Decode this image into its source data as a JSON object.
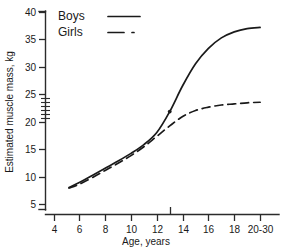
{
  "chart_data": {
    "type": "line",
    "title": "",
    "xlabel": "Age, years",
    "ylabel": "Estimated muscle mass, kg",
    "xlim": [
      4,
      21
    ],
    "ylim": [
      4,
      40
    ],
    "grid": false,
    "legend_position": "top-left",
    "x_tick_labels": [
      "4",
      "6",
      "8",
      "10",
      "12",
      "14",
      "16",
      "18",
      "20-30"
    ],
    "x_tick_values": [
      4,
      6,
      8,
      10,
      12,
      14,
      16,
      18,
      20
    ],
    "y_tick_labels": [
      "5",
      "10",
      "15",
      "20",
      "25",
      "30",
      "35",
      "40"
    ],
    "y_tick_values": [
      5,
      10,
      15,
      20,
      25,
      30,
      35,
      40
    ],
    "y_minor_tick_values": [
      20.7,
      21.4,
      22.1,
      22.8,
      23.5,
      24.2
    ],
    "x_marker_value": 13,
    "series": [
      {
        "name": "Boys",
        "style": "solid",
        "x": [
          5.2,
          6,
          7,
          8,
          9,
          10,
          11,
          12,
          13,
          14,
          15,
          16,
          17,
          18,
          19,
          20
        ],
        "values": [
          8.0,
          8.9,
          10.2,
          11.5,
          12.8,
          14.2,
          15.8,
          18.0,
          21.8,
          26.5,
          30.5,
          33.3,
          35.2,
          36.3,
          36.9,
          37.1
        ]
      },
      {
        "name": "Girls",
        "style": "dashed",
        "x": [
          5.2,
          6,
          7,
          8,
          9,
          10,
          11,
          12,
          13,
          14,
          15,
          16,
          17,
          18,
          19,
          20
        ],
        "values": [
          7.9,
          8.6,
          9.8,
          11.1,
          12.4,
          13.8,
          15.4,
          17.3,
          19.2,
          20.9,
          22.0,
          22.6,
          23.0,
          23.2,
          23.4,
          23.5
        ]
      }
    ]
  },
  "legend": {
    "items": [
      {
        "label": "Boys",
        "style": "solid"
      },
      {
        "label": "Girls",
        "style": "dash-dot"
      }
    ]
  },
  "axes": {
    "x_title": "Age, years",
    "y_title": "Estimated muscle mass, kg"
  }
}
